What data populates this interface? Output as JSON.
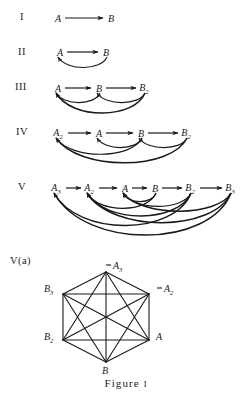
{
  "figure": {
    "caption_text": "Figure",
    "caption_number": "I",
    "ink_color": "#1a1a1a",
    "background_color": "#ffffff"
  },
  "rows": [
    {
      "label": "I",
      "label_x": 20,
      "label_y": 18,
      "baseline_y": 18,
      "nodes": [
        {
          "name": "A",
          "base": "A",
          "sub": "",
          "x": 58,
          "y": 18
        },
        {
          "name": "B",
          "base": "B",
          "sub": "",
          "x": 111,
          "y": 18
        }
      ],
      "forward_arrows": [
        {
          "from": 0,
          "to": 1
        }
      ],
      "back_arrows": []
    },
    {
      "label": "II",
      "label_x": 18,
      "label_y": 53,
      "baseline_y": 53,
      "nodes": [
        {
          "name": "A",
          "base": "A",
          "sub": "",
          "x": 60,
          "y": 52
        },
        {
          "name": "B",
          "base": "B",
          "sub": "",
          "x": 106,
          "y": 52
        }
      ],
      "forward_arrows": [
        {
          "from": 0,
          "to": 1
        }
      ],
      "back_arrows": [
        {
          "from": 1,
          "to": 0,
          "depth": 11
        }
      ]
    },
    {
      "label": "III",
      "label_x": 15,
      "label_y": 88,
      "baseline_y": 88,
      "nodes": [
        {
          "name": "A",
          "base": "A",
          "sub": "",
          "x": 58,
          "y": 88
        },
        {
          "name": "B",
          "base": "B",
          "sub": "",
          "x": 99,
          "y": 88
        },
        {
          "name": "B2",
          "base": "B",
          "sub": "2",
          "x": 144,
          "y": 88
        }
      ],
      "forward_arrows": [
        {
          "from": 0,
          "to": 1
        },
        {
          "from": 1,
          "to": 2
        }
      ],
      "back_arrows": [
        {
          "from": 1,
          "to": 0,
          "depth": 10
        },
        {
          "from": 2,
          "to": 1,
          "depth": 10
        },
        {
          "from": 2,
          "to": 0,
          "depth": 21
        }
      ]
    },
    {
      "label": "IV",
      "label_x": 16,
      "label_y": 133,
      "baseline_y": 133,
      "nodes": [
        {
          "name": "A2",
          "base": "A",
          "sub": "2",
          "x": 58,
          "y": 133
        },
        {
          "name": "A",
          "base": "A",
          "sub": "",
          "x": 99,
          "y": 133
        },
        {
          "name": "B",
          "base": "B",
          "sub": "",
          "x": 141,
          "y": 133
        },
        {
          "name": "B2",
          "base": "B",
          "sub": "2",
          "x": 186,
          "y": 133
        }
      ],
      "forward_arrows": [
        {
          "from": 0,
          "to": 1
        },
        {
          "from": 1,
          "to": 2
        },
        {
          "from": 2,
          "to": 3
        }
      ],
      "back_arrows": [
        {
          "from": 2,
          "to": 1,
          "depth": 10
        },
        {
          "from": 3,
          "to": 2,
          "depth": 10
        },
        {
          "from": 2,
          "to": 0,
          "depth": 17
        },
        {
          "from": 3,
          "to": 0,
          "depth": 26
        }
      ]
    },
    {
      "label": "V",
      "label_x": 18,
      "label_y": 188,
      "baseline_y": 188,
      "nodes": [
        {
          "name": "A3",
          "base": "A",
          "sub": "3",
          "x": 56,
          "y": 188
        },
        {
          "name": "A2",
          "base": "A",
          "sub": "2",
          "x": 89,
          "y": 188
        },
        {
          "name": "A",
          "base": "A",
          "sub": "",
          "x": 125,
          "y": 188
        },
        {
          "name": "B",
          "base": "B",
          "sub": "",
          "x": 155,
          "y": 188
        },
        {
          "name": "B2",
          "base": "B",
          "sub": "2",
          "x": 190,
          "y": 188
        },
        {
          "name": "B3",
          "base": "B",
          "sub": "3",
          "x": 230,
          "y": 188
        }
      ],
      "forward_arrows": [
        {
          "from": 0,
          "to": 1
        },
        {
          "from": 1,
          "to": 2
        },
        {
          "from": 2,
          "to": 3
        },
        {
          "from": 3,
          "to": 4
        },
        {
          "from": 4,
          "to": 5
        }
      ],
      "back_arrows": [
        {
          "from": 3,
          "to": 2,
          "depth": 9
        },
        {
          "from": 4,
          "to": 2,
          "depth": 14
        },
        {
          "from": 5,
          "to": 2,
          "depth": 19
        },
        {
          "from": 3,
          "to": 1,
          "depth": 16
        },
        {
          "from": 4,
          "to": 1,
          "depth": 24
        },
        {
          "from": 5,
          "to": 1,
          "depth": 31
        },
        {
          "from": 4,
          "to": 0,
          "depth": 34
        },
        {
          "from": 5,
          "to": 0,
          "depth": 44
        }
      ]
    }
  ],
  "hexagon": {
    "label": "V(a)",
    "label_x": 10,
    "label_y": 262,
    "center_x": 106,
    "center_y": 317,
    "radius_x": 45,
    "radius_y": 46,
    "vertices": [
      {
        "name": "A3",
        "base": "A",
        "sub": "3",
        "x": 106,
        "y": 272,
        "label_x": 113,
        "label_y": 266,
        "tick": true,
        "tick_side": "left"
      },
      {
        "name": "A2",
        "base": "A",
        "sub": "2",
        "x": 149,
        "y": 294,
        "label_x": 164,
        "label_y": 289,
        "tick": true,
        "tick_side": "left"
      },
      {
        "name": "A",
        "base": "A",
        "sub": "",
        "x": 149,
        "y": 340,
        "label_x": 156,
        "label_y": 337,
        "tick": false,
        "tick_side": ""
      },
      {
        "name": "B",
        "base": "B",
        "sub": "",
        "x": 106,
        "y": 362,
        "label_x": 102,
        "label_y": 371,
        "tick": false,
        "tick_side": ""
      },
      {
        "name": "B2",
        "base": "B",
        "sub": "2",
        "x": 63,
        "y": 340,
        "label_x": 44,
        "label_y": 337,
        "tick": false,
        "tick_side": ""
      },
      {
        "name": "B3",
        "base": "B",
        "sub": "3",
        "x": 63,
        "y": 294,
        "label_x": 44,
        "label_y": 289,
        "tick": false,
        "tick_side": ""
      }
    ],
    "edge_note": "complete-graph-K6-all-15-edges"
  },
  "caption_y": 377
}
